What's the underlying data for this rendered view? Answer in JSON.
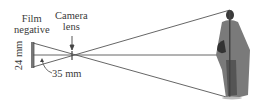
{
  "diagram": {
    "labels": {
      "film_line1": "Film",
      "film_line2": "negative",
      "camera_line1": "Camera",
      "camera_line2": "lens",
      "height": "24 mm",
      "distance": "35 mm"
    },
    "colors": {
      "ray": "#555555",
      "film": "#666666",
      "statue_dark": "#3a3a3a",
      "statue_mid": "#7a7a7a"
    }
  }
}
